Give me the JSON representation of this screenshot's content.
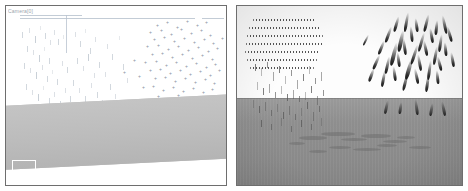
{
  "figure": {
    "title": "",
    "background_color": "#ffffff",
    "panel_border_color": "#6e6e6e",
    "panel_count": 2
  },
  "left_panel": {
    "name": "left-simulation-view",
    "corner_label": "Camera[0]",
    "sky_color": "#ffffff",
    "ground_color": "#bdbdbd",
    "ground_tilt_degrees": -2.9,
    "marker_color": "#8892a0",
    "tick_color": "#b6bfc9",
    "rule_color": "#b9c3cf",
    "selection_box": {
      "name": "selection-box",
      "visible": true,
      "stroke_color": "#ffffff"
    },
    "rules": [
      {
        "x": 14,
        "y": 12,
        "width": 175
      },
      {
        "x": 196,
        "y": 12,
        "width": 22
      },
      {
        "x": 14,
        "y": 9,
        "width": 62
      }
    ],
    "vertical_rules": [
      {
        "x": 60,
        "y": 9,
        "height": 38
      }
    ],
    "ticks": [
      {
        "x": 16,
        "y": 26,
        "h": 6
      },
      {
        "x": 23,
        "y": 22,
        "h": 5
      },
      {
        "x": 29,
        "y": 30,
        "h": 7
      },
      {
        "x": 34,
        "y": 20,
        "h": 4
      },
      {
        "x": 39,
        "y": 27,
        "h": 6
      },
      {
        "x": 44,
        "y": 34,
        "h": 5
      },
      {
        "x": 21,
        "y": 40,
        "h": 6
      },
      {
        "x": 27,
        "y": 44,
        "h": 5
      },
      {
        "x": 33,
        "y": 49,
        "h": 7
      },
      {
        "x": 38,
        "y": 41,
        "h": 4
      },
      {
        "x": 43,
        "y": 52,
        "h": 6
      },
      {
        "x": 48,
        "y": 24,
        "h": 5
      },
      {
        "x": 52,
        "y": 33,
        "h": 6
      },
      {
        "x": 57,
        "y": 29,
        "h": 4
      },
      {
        "x": 18,
        "y": 57,
        "h": 6
      },
      {
        "x": 24,
        "y": 62,
        "h": 5
      },
      {
        "x": 30,
        "y": 66,
        "h": 7
      },
      {
        "x": 36,
        "y": 59,
        "h": 5
      },
      {
        "x": 41,
        "y": 70,
        "h": 6
      },
      {
        "x": 46,
        "y": 64,
        "h": 4
      },
      {
        "x": 51,
        "y": 73,
        "h": 6
      },
      {
        "x": 56,
        "y": 55,
        "h": 5
      },
      {
        "x": 61,
        "y": 61,
        "h": 6
      },
      {
        "x": 20,
        "y": 78,
        "h": 6
      },
      {
        "x": 26,
        "y": 84,
        "h": 5
      },
      {
        "x": 32,
        "y": 88,
        "h": 7
      },
      {
        "x": 37,
        "y": 80,
        "h": 4
      },
      {
        "x": 43,
        "y": 92,
        "h": 6
      },
      {
        "x": 48,
        "y": 86,
        "h": 5
      },
      {
        "x": 54,
        "y": 95,
        "h": 6
      },
      {
        "x": 59,
        "y": 82,
        "h": 5
      },
      {
        "x": 64,
        "y": 90,
        "h": 6
      },
      {
        "x": 69,
        "y": 26,
        "h": 5
      },
      {
        "x": 74,
        "y": 35,
        "h": 6
      },
      {
        "x": 79,
        "y": 23,
        "h": 4
      },
      {
        "x": 84,
        "y": 42,
        "h": 6
      },
      {
        "x": 89,
        "y": 31,
        "h": 5
      },
      {
        "x": 71,
        "y": 52,
        "h": 6
      },
      {
        "x": 77,
        "y": 60,
        "h": 5
      },
      {
        "x": 82,
        "y": 48,
        "h": 7
      },
      {
        "x": 88,
        "y": 67,
        "h": 5
      },
      {
        "x": 93,
        "y": 56,
        "h": 6
      },
      {
        "x": 67,
        "y": 74,
        "h": 6
      },
      {
        "x": 73,
        "y": 82,
        "h": 5
      },
      {
        "x": 79,
        "y": 90,
        "h": 6
      },
      {
        "x": 85,
        "y": 77,
        "h": 5
      },
      {
        "x": 91,
        "y": 86,
        "h": 6
      },
      {
        "x": 96,
        "y": 94,
        "h": 5
      },
      {
        "x": 101,
        "y": 38,
        "h": 5
      },
      {
        "x": 106,
        "y": 48,
        "h": 6
      },
      {
        "x": 99,
        "y": 66,
        "h": 5
      },
      {
        "x": 104,
        "y": 78,
        "h": 6
      },
      {
        "x": 109,
        "y": 88,
        "h": 5
      },
      {
        "x": 113,
        "y": 30,
        "h": 4
      },
      {
        "x": 117,
        "y": 58,
        "h": 6
      },
      {
        "x": 121,
        "y": 72,
        "h": 5
      },
      {
        "x": 36,
        "y": 100,
        "h": 6
      },
      {
        "x": 45,
        "y": 104,
        "h": 5
      },
      {
        "x": 55,
        "y": 99,
        "h": 6
      },
      {
        "x": 64,
        "y": 103,
        "h": 5
      },
      {
        "x": 74,
        "y": 101,
        "h": 6
      },
      {
        "x": 84,
        "y": 105,
        "h": 5
      },
      {
        "x": 93,
        "y": 100,
        "h": 6
      },
      {
        "x": 103,
        "y": 104,
        "h": 5
      }
    ],
    "plus_markers": [
      {
        "x": 150,
        "y": 17
      },
      {
        "x": 160,
        "y": 14
      },
      {
        "x": 170,
        "y": 19
      },
      {
        "x": 180,
        "y": 13
      },
      {
        "x": 190,
        "y": 17
      },
      {
        "x": 199,
        "y": 14
      },
      {
        "x": 143,
        "y": 24
      },
      {
        "x": 154,
        "y": 22
      },
      {
        "x": 164,
        "y": 26
      },
      {
        "x": 174,
        "y": 21
      },
      {
        "x": 184,
        "y": 25
      },
      {
        "x": 194,
        "y": 22
      },
      {
        "x": 203,
        "y": 27
      },
      {
        "x": 147,
        "y": 31
      },
      {
        "x": 157,
        "y": 29
      },
      {
        "x": 167,
        "y": 33
      },
      {
        "x": 177,
        "y": 30
      },
      {
        "x": 187,
        "y": 34
      },
      {
        "x": 197,
        "y": 31
      },
      {
        "x": 206,
        "y": 35
      },
      {
        "x": 140,
        "y": 38
      },
      {
        "x": 151,
        "y": 37
      },
      {
        "x": 161,
        "y": 41
      },
      {
        "x": 171,
        "y": 38
      },
      {
        "x": 181,
        "y": 42
      },
      {
        "x": 191,
        "y": 39
      },
      {
        "x": 201,
        "y": 43
      },
      {
        "x": 210,
        "y": 40
      },
      {
        "x": 145,
        "y": 46
      },
      {
        "x": 155,
        "y": 45
      },
      {
        "x": 165,
        "y": 49
      },
      {
        "x": 175,
        "y": 46
      },
      {
        "x": 185,
        "y": 50
      },
      {
        "x": 195,
        "y": 47
      },
      {
        "x": 205,
        "y": 51
      },
      {
        "x": 138,
        "y": 54
      },
      {
        "x": 149,
        "y": 53
      },
      {
        "x": 159,
        "y": 57
      },
      {
        "x": 169,
        "y": 54
      },
      {
        "x": 179,
        "y": 58
      },
      {
        "x": 189,
        "y": 55
      },
      {
        "x": 199,
        "y": 59
      },
      {
        "x": 208,
        "y": 56
      },
      {
        "x": 143,
        "y": 62
      },
      {
        "x": 153,
        "y": 61
      },
      {
        "x": 163,
        "y": 65
      },
      {
        "x": 173,
        "y": 62
      },
      {
        "x": 183,
        "y": 66
      },
      {
        "x": 193,
        "y": 63
      },
      {
        "x": 203,
        "y": 67
      },
      {
        "x": 148,
        "y": 70
      },
      {
        "x": 158,
        "y": 69
      },
      {
        "x": 168,
        "y": 73
      },
      {
        "x": 178,
        "y": 70
      },
      {
        "x": 188,
        "y": 74
      },
      {
        "x": 198,
        "y": 71
      },
      {
        "x": 207,
        "y": 75
      },
      {
        "x": 127,
        "y": 52
      },
      {
        "x": 132,
        "y": 68
      },
      {
        "x": 136,
        "y": 79
      },
      {
        "x": 146,
        "y": 78
      },
      {
        "x": 156,
        "y": 82
      },
      {
        "x": 166,
        "y": 79
      },
      {
        "x": 176,
        "y": 83
      },
      {
        "x": 186,
        "y": 80
      },
      {
        "x": 196,
        "y": 84
      },
      {
        "x": 205,
        "y": 81
      },
      {
        "x": 151,
        "y": 88
      },
      {
        "x": 161,
        "y": 91
      },
      {
        "x": 171,
        "y": 87
      },
      {
        "x": 181,
        "y": 92
      },
      {
        "x": 191,
        "y": 89
      },
      {
        "x": 200,
        "y": 93
      },
      {
        "x": 158,
        "y": 97
      },
      {
        "x": 168,
        "y": 99
      },
      {
        "x": 178,
        "y": 96
      },
      {
        "x": 188,
        "y": 100
      },
      {
        "x": 197,
        "y": 97
      },
      {
        "x": 212,
        "y": 62
      },
      {
        "x": 215,
        "y": 30
      },
      {
        "x": 117,
        "y": 64
      },
      {
        "x": 210,
        "y": 99
      },
      {
        "x": 203,
        "y": 104
      }
    ]
  },
  "right_panel": {
    "name": "right-simulation-view",
    "sky_color": "#fdfdfd",
    "ground_color": "#8e8e8e",
    "horizon_y": 92,
    "streak_color": "#141414",
    "spray_color": "#5a5a5a",
    "smudge_color": "#6b6b6b",
    "text_block_lines": [
      {
        "x": 16,
        "y": 13,
        "width": 62
      },
      {
        "x": 12,
        "y": 21,
        "width": 72
      },
      {
        "x": 10,
        "y": 29,
        "width": 76
      },
      {
        "x": 9,
        "y": 37,
        "width": 78
      },
      {
        "x": 8,
        "y": 45,
        "width": 74
      },
      {
        "x": 10,
        "y": 53,
        "width": 70
      },
      {
        "x": 13,
        "y": 61,
        "width": 64
      }
    ],
    "streaks": [
      {
        "x": 158,
        "y": 10,
        "w": 3,
        "h": 16,
        "rot": 16
      },
      {
        "x": 168,
        "y": 6,
        "w": 3,
        "h": 20,
        "rot": 10
      },
      {
        "x": 178,
        "y": 12,
        "w": 3,
        "h": 14,
        "rot": -8
      },
      {
        "x": 188,
        "y": 8,
        "w": 3,
        "h": 18,
        "rot": 14
      },
      {
        "x": 198,
        "y": 14,
        "w": 3,
        "h": 15,
        "rot": 6
      },
      {
        "x": 206,
        "y": 9,
        "w": 3,
        "h": 19,
        "rot": -12
      },
      {
        "x": 150,
        "y": 20,
        "w": 3,
        "h": 17,
        "rot": 20
      },
      {
        "x": 162,
        "y": 24,
        "w": 4,
        "h": 22,
        "rot": 12
      },
      {
        "x": 173,
        "y": 20,
        "w": 3,
        "h": 16,
        "rot": -6
      },
      {
        "x": 183,
        "y": 26,
        "w": 3,
        "h": 20,
        "rot": 16
      },
      {
        "x": 193,
        "y": 22,
        "w": 3,
        "h": 15,
        "rot": -10
      },
      {
        "x": 202,
        "y": 28,
        "w": 3,
        "h": 18,
        "rot": 8
      },
      {
        "x": 143,
        "y": 34,
        "w": 3,
        "h": 15,
        "rot": 22
      },
      {
        "x": 155,
        "y": 36,
        "w": 4,
        "h": 24,
        "rot": 14
      },
      {
        "x": 166,
        "y": 32,
        "w": 3,
        "h": 17,
        "rot": -8
      },
      {
        "x": 176,
        "y": 38,
        "w": 3,
        "h": 21,
        "rot": 18
      },
      {
        "x": 187,
        "y": 34,
        "w": 3,
        "h": 16,
        "rot": -12
      },
      {
        "x": 197,
        "y": 40,
        "w": 3,
        "h": 19,
        "rot": 10
      },
      {
        "x": 207,
        "y": 36,
        "w": 3,
        "h": 14,
        "rot": -6
      },
      {
        "x": 138,
        "y": 48,
        "w": 3,
        "h": 16,
        "rot": 24
      },
      {
        "x": 149,
        "y": 50,
        "w": 3,
        "h": 18,
        "rot": 12
      },
      {
        "x": 160,
        "y": 46,
        "w": 3,
        "h": 15,
        "rot": -8
      },
      {
        "x": 170,
        "y": 52,
        "w": 4,
        "h": 22,
        "rot": 16
      },
      {
        "x": 181,
        "y": 48,
        "w": 3,
        "h": 17,
        "rot": -10
      },
      {
        "x": 191,
        "y": 54,
        "w": 3,
        "h": 20,
        "rot": 8
      },
      {
        "x": 201,
        "y": 50,
        "w": 3,
        "h": 15,
        "rot": -14
      },
      {
        "x": 133,
        "y": 62,
        "w": 3,
        "h": 14,
        "rot": 20
      },
      {
        "x": 145,
        "y": 64,
        "w": 3,
        "h": 17,
        "rot": 10
      },
      {
        "x": 156,
        "y": 60,
        "w": 3,
        "h": 15,
        "rot": -8
      },
      {
        "x": 167,
        "y": 66,
        "w": 3,
        "h": 19,
        "rot": 14
      },
      {
        "x": 178,
        "y": 62,
        "w": 3,
        "h": 16,
        "rot": -12
      },
      {
        "x": 189,
        "y": 68,
        "w": 3,
        "h": 18,
        "rot": 8
      },
      {
        "x": 199,
        "y": 64,
        "w": 3,
        "h": 14,
        "rot": -6
      },
      {
        "x": 128,
        "y": 28,
        "w": 2,
        "h": 12,
        "rot": 26
      },
      {
        "x": 211,
        "y": 20,
        "w": 3,
        "h": 16,
        "rot": -16
      },
      {
        "x": 214,
        "y": 46,
        "w": 3,
        "h": 15,
        "rot": -10
      }
    ],
    "ground_streaks": [
      {
        "x": 148,
        "y": 94,
        "w": 3,
        "h": 14,
        "rot": 12
      },
      {
        "x": 162,
        "y": 96,
        "w": 3,
        "h": 12,
        "rot": 8
      },
      {
        "x": 178,
        "y": 93,
        "w": 3,
        "h": 16,
        "rot": -8
      },
      {
        "x": 193,
        "y": 97,
        "w": 3,
        "h": 13,
        "rot": 10
      },
      {
        "x": 205,
        "y": 95,
        "w": 3,
        "h": 15,
        "rot": -12
      }
    ],
    "spray": [
      {
        "x": 18,
        "y": 58,
        "h": 7
      },
      {
        "x": 24,
        "y": 62,
        "h": 8
      },
      {
        "x": 30,
        "y": 56,
        "h": 6
      },
      {
        "x": 36,
        "y": 66,
        "h": 9
      },
      {
        "x": 42,
        "y": 60,
        "h": 7
      },
      {
        "x": 48,
        "y": 70,
        "h": 8
      },
      {
        "x": 54,
        "y": 64,
        "h": 6
      },
      {
        "x": 60,
        "y": 74,
        "h": 9
      },
      {
        "x": 66,
        "y": 68,
        "h": 7
      },
      {
        "x": 72,
        "y": 60,
        "h": 8
      },
      {
        "x": 78,
        "y": 72,
        "h": 6
      },
      {
        "x": 84,
        "y": 66,
        "h": 9
      },
      {
        "x": 20,
        "y": 76,
        "h": 8
      },
      {
        "x": 26,
        "y": 82,
        "h": 7
      },
      {
        "x": 32,
        "y": 78,
        "h": 9
      },
      {
        "x": 38,
        "y": 86,
        "h": 6
      },
      {
        "x": 44,
        "y": 80,
        "h": 8
      },
      {
        "x": 50,
        "y": 88,
        "h": 7
      },
      {
        "x": 56,
        "y": 84,
        "h": 9
      },
      {
        "x": 62,
        "y": 90,
        "h": 6
      },
      {
        "x": 68,
        "y": 86,
        "h": 8
      },
      {
        "x": 74,
        "y": 80,
        "h": 7
      },
      {
        "x": 80,
        "y": 90,
        "h": 9
      },
      {
        "x": 86,
        "y": 84,
        "h": 6
      },
      {
        "x": 16,
        "y": 94,
        "h": 8
      },
      {
        "x": 22,
        "y": 100,
        "h": 7
      },
      {
        "x": 28,
        "y": 96,
        "h": 9
      },
      {
        "x": 34,
        "y": 104,
        "h": 6
      },
      {
        "x": 40,
        "y": 98,
        "h": 8
      },
      {
        "x": 46,
        "y": 106,
        "h": 7
      },
      {
        "x": 52,
        "y": 100,
        "h": 9
      },
      {
        "x": 58,
        "y": 108,
        "h": 6
      },
      {
        "x": 64,
        "y": 102,
        "h": 8
      },
      {
        "x": 70,
        "y": 96,
        "h": 7
      },
      {
        "x": 76,
        "y": 106,
        "h": 9
      },
      {
        "x": 82,
        "y": 100,
        "h": 6
      },
      {
        "x": 24,
        "y": 114,
        "h": 7
      },
      {
        "x": 34,
        "y": 118,
        "h": 6
      },
      {
        "x": 44,
        "y": 112,
        "h": 8
      },
      {
        "x": 54,
        "y": 120,
        "h": 6
      },
      {
        "x": 64,
        "y": 114,
        "h": 7
      },
      {
        "x": 74,
        "y": 118,
        "h": 6
      },
      {
        "x": 84,
        "y": 112,
        "h": 8
      }
    ],
    "smudges": [
      {
        "x": 62,
        "y": 130,
        "w": 28,
        "h": 4
      },
      {
        "x": 84,
        "y": 126,
        "w": 34,
        "h": 4
      },
      {
        "x": 104,
        "y": 132,
        "w": 26,
        "h": 3
      },
      {
        "x": 124,
        "y": 128,
        "w": 30,
        "h": 4
      },
      {
        "x": 146,
        "y": 134,
        "w": 24,
        "h": 3
      },
      {
        "x": 92,
        "y": 140,
        "w": 22,
        "h": 3
      },
      {
        "x": 116,
        "y": 142,
        "w": 28,
        "h": 3
      },
      {
        "x": 140,
        "y": 138,
        "w": 20,
        "h": 3
      },
      {
        "x": 160,
        "y": 130,
        "w": 18,
        "h": 3
      },
      {
        "x": 72,
        "y": 144,
        "w": 18,
        "h": 3
      },
      {
        "x": 52,
        "y": 136,
        "w": 16,
        "h": 3
      },
      {
        "x": 172,
        "y": 140,
        "w": 22,
        "h": 3
      }
    ]
  }
}
